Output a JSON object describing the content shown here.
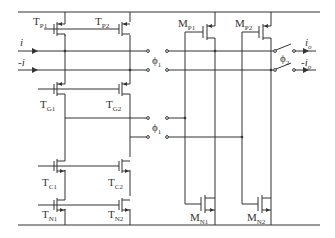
{
  "diagram": {
    "type": "circuit-schematic",
    "inputs": [
      {
        "name": "i",
        "label": "i"
      },
      {
        "name": "neg-i",
        "label": "-i"
      }
    ],
    "outputs": [
      {
        "name": "io",
        "label": "i",
        "sub": "o"
      },
      {
        "name": "neg-io",
        "label": "-i",
        "sub": "o"
      }
    ],
    "transistors": [
      {
        "id": "TP1",
        "base": "T",
        "sub": "P1"
      },
      {
        "id": "TP2",
        "base": "T",
        "sub": "P2"
      },
      {
        "id": "TG1",
        "base": "T",
        "sub": "G1"
      },
      {
        "id": "TG2",
        "base": "T",
        "sub": "G2"
      },
      {
        "id": "TC1",
        "base": "T",
        "sub": "C1"
      },
      {
        "id": "TC2",
        "base": "T",
        "sub": "C2"
      },
      {
        "id": "TN1",
        "base": "T",
        "sub": "N1"
      },
      {
        "id": "TN2",
        "base": "T",
        "sub": "N2"
      },
      {
        "id": "MP1",
        "base": "M",
        "sub": "P1"
      },
      {
        "id": "MP2",
        "base": "M",
        "sub": "P2"
      },
      {
        "id": "MN1",
        "base": "M",
        "sub": "N1"
      },
      {
        "id": "MN2",
        "base": "M",
        "sub": "N2"
      }
    ],
    "switches": [
      {
        "id": "phi1-top",
        "base": "ϕ",
        "sub": "1"
      },
      {
        "id": "phi1-bottom",
        "base": "ϕ",
        "sub": "1"
      },
      {
        "id": "phi2",
        "base": "ϕ",
        "sub": "2"
      }
    ],
    "colors": {
      "wire": "#333333",
      "background": "#ffffff"
    }
  }
}
